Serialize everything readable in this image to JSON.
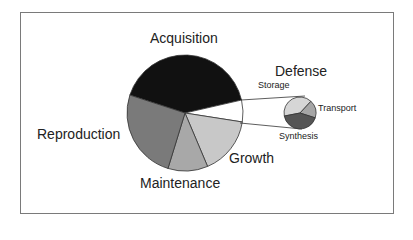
{
  "chart_data": {
    "type": "pie",
    "title": "",
    "main_pie": {
      "categories": [
        "Acquisition",
        "Defense",
        "Growth",
        "Maintenance",
        "Reproduction"
      ],
      "values": [
        41,
        6,
        16,
        11,
        25
      ],
      "colors": [
        "#111111",
        "#ffffff",
        "#c8c8c8",
        "#a8a8a8",
        "#7a7a7a"
      ]
    },
    "sub_pie": {
      "parent": "Defense",
      "categories": [
        "Storage",
        "Transport",
        "Synthesis"
      ],
      "values": [
        40,
        18,
        42
      ],
      "colors": [
        "#d6d6d6",
        "#a6a6a6",
        "#555555"
      ]
    }
  },
  "labels": {
    "acquisition": "Acquisition",
    "reproduction": "Reproduction",
    "maintenance": "Maintenance",
    "growth": "Growth",
    "defense": "Defense",
    "storage": "Storage",
    "transport": "Transport",
    "synthesis": "Synthesis"
  }
}
